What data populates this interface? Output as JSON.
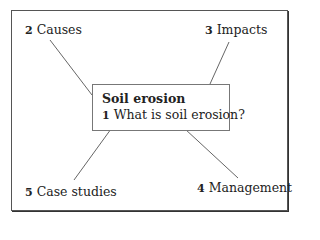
{
  "diagram": {
    "type": "mind-map",
    "center": {
      "title": "Soil erosion",
      "number": "1",
      "label": "What is soil erosion?"
    },
    "nodes": [
      {
        "number": "2",
        "label": "Causes",
        "position": "top-left"
      },
      {
        "number": "3",
        "label": "Impacts",
        "position": "top-right"
      },
      {
        "number": "4",
        "label": "Management",
        "position": "bottom-right"
      },
      {
        "number": "5",
        "label": "Case studies",
        "position": "bottom-left"
      }
    ],
    "colors": {
      "frame": "#555555",
      "lines": "#666666",
      "text": "#222222",
      "background": "#ffffff"
    }
  }
}
